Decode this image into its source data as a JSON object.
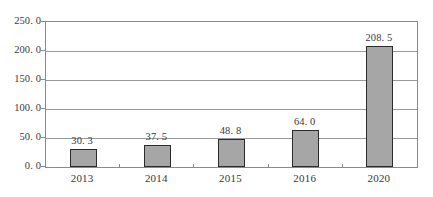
{
  "chart_data": {
    "type": "bar",
    "title": "",
    "xlabel": "",
    "ylabel": "",
    "categories": [
      "2013",
      "2014",
      "2015",
      "2016",
      "2020"
    ],
    "values": [
      30.3,
      37.5,
      48.8,
      64.0,
      208.5
    ],
    "value_labels": [
      "30. 3",
      "37. 5",
      "48. 8",
      "64. 0",
      "208. 5"
    ],
    "ylim": [
      0,
      250
    ],
    "ytick_values": [
      0,
      50,
      100,
      150,
      200,
      250
    ],
    "ytick_labels": [
      "0. 0",
      "50. 0",
      "100. 0",
      "150. 0",
      "200. 0",
      "250. 0"
    ],
    "grid": true,
    "legend": "none",
    "bar_fill_color": "#a6a6a6",
    "bar_border_color": "#2b2b2b",
    "grid_color": "#9a9a9a",
    "frame_color": "#8a8a8a",
    "background_color": "#ffffff"
  }
}
